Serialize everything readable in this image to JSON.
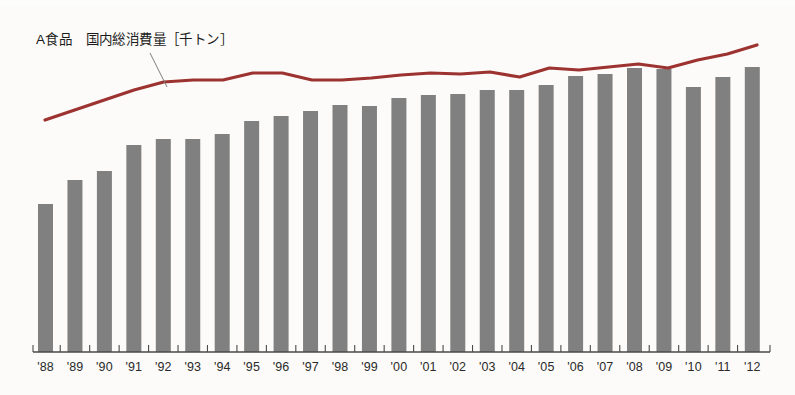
{
  "chart_data": {
    "type": "bar",
    "title": "",
    "xlabel": "",
    "ylabel": "",
    "grid": false,
    "legend_position": "inline-callout",
    "series_label": "A食品　国内総消費量［千トン］",
    "categories": [
      "'88",
      "'89",
      "'90",
      "'91",
      "'92",
      "'93",
      "'94",
      "'95",
      "'96",
      "'97",
      "'98",
      "'99",
      "'00",
      "'01",
      "'02",
      "'03",
      "'04",
      "'05",
      "'06",
      "'07",
      "'08",
      "'09",
      "'10",
      "'11",
      "'12"
    ],
    "series": [
      {
        "name": "国内総消費量（棒）",
        "type": "bar",
        "color": "#808080",
        "values": [
          148,
          172,
          181,
          207,
          213,
          213,
          218,
          231,
          236,
          241,
          247,
          246,
          254,
          257,
          258,
          262,
          262,
          267,
          276,
          278,
          284,
          283,
          265,
          275,
          285
        ]
      },
      {
        "name": "国内総消費量（折れ線）",
        "type": "line",
        "color": "#9c3330",
        "values": [
          232,
          242,
          252,
          262,
          270,
          272,
          272,
          279,
          279,
          272,
          272,
          274,
          277,
          279,
          278,
          280,
          275,
          284,
          282,
          285,
          288,
          284,
          292,
          298,
          307
        ]
      }
    ],
    "ylim": [
      0,
      352
    ],
    "xlim": [
      "'88",
      "'12"
    ],
    "axis_color": "#4a4a4a",
    "background": "#fcfbf9"
  },
  "geometry": {
    "baseline_y": 352,
    "axis_left_x": 33,
    "axis_right_x": 770,
    "bar_first_center_x": 45.5,
    "bar_pitch": 29.45,
    "bar_width": 15,
    "value_scale": 1.0,
    "line_start_x": 45,
    "line_end_x": 757,
    "tick_height": 7,
    "callout_from": [
      150,
      53
    ],
    "callout_to": [
      167,
      87
    ],
    "tick_label_y": 360
  }
}
